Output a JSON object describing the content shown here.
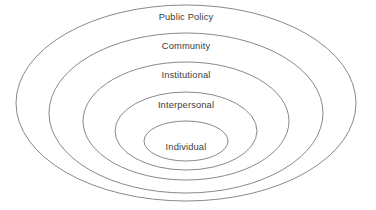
{
  "diagram": {
    "type": "nested-ellipses",
    "background_color": "#ffffff",
    "stroke_color": "#7b7b7b",
    "text_color": "#3c3c3c",
    "levels": [
      {
        "id": "public-policy",
        "label": "Public Policy",
        "order": 1,
        "cx": 186,
        "cy": 103,
        "rx": 170,
        "ry": 98,
        "label_x": 186,
        "label_y": 18
      },
      {
        "id": "community",
        "label": "Community",
        "order": 2,
        "cx": 186,
        "cy": 113,
        "rx": 137,
        "ry": 80,
        "label_x": 186,
        "label_y": 47
      },
      {
        "id": "institutional",
        "label": "Institutional",
        "order": 3,
        "cx": 186,
        "cy": 121,
        "rx": 103,
        "ry": 59,
        "label_x": 186,
        "label_y": 76
      },
      {
        "id": "interpersonal",
        "label": "Interpersonal",
        "order": 4,
        "cx": 186,
        "cy": 131,
        "rx": 71,
        "ry": 39,
        "label_x": 186,
        "label_y": 106
      },
      {
        "id": "individual",
        "label": "Individual",
        "order": 5,
        "cx": 186,
        "cy": 141,
        "rx": 42,
        "ry": 20,
        "label_x": 186,
        "label_y": 148
      }
    ]
  }
}
